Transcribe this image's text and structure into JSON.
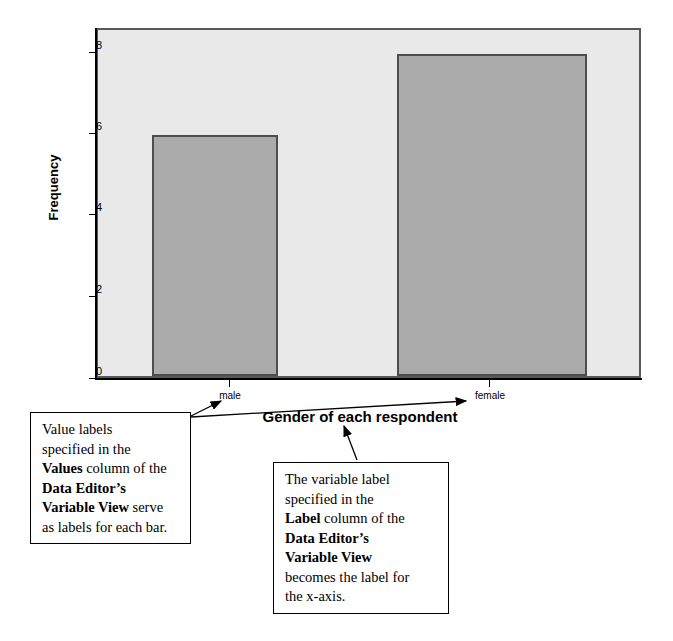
{
  "chart_data": {
    "type": "bar",
    "title": "",
    "xlabel": "Gender of each respondent",
    "ylabel": "Frequency",
    "categories": [
      "male",
      "female"
    ],
    "values": [
      6,
      8
    ],
    "yticks": [
      0,
      2,
      4,
      6,
      8
    ],
    "ylim": [
      0,
      8.6
    ],
    "grid": false,
    "legend": "none",
    "bar_fill_color": "#ababab",
    "bar_border_color": "#4c4d4f",
    "plot_background_color": "#e9e9e9",
    "axis_color": "#000000"
  },
  "annotations": {
    "left_callout": {
      "line1": "Value labels",
      "line2": "specified in the",
      "line3_bold": "Values",
      "line3_rest": " column of the",
      "line4_bold": "Data Editor’s",
      "line5_bold": "Variable View",
      "line5_rest": " serve",
      "line6": "as labels for each bar."
    },
    "right_callout": {
      "line1": "The variable label",
      "line2": "specified in the",
      "line3_bold": "Label",
      "line3_rest": " column of the",
      "line4_bold": "Data Editor’s",
      "line5_bold": "Variable View",
      "line6": "becomes the label for",
      "line7": "the x-axis."
    }
  }
}
